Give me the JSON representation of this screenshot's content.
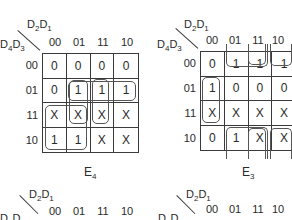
{
  "maps": [
    {
      "title": "E",
      "title_sub": "4",
      "col_var": {
        "a": "D",
        "a_sub": "2",
        "b": "D",
        "b_sub": "1"
      },
      "row_var": {
        "a": "D",
        "a_sub": "4",
        "b": "D",
        "b_sub": "3"
      },
      "col_labels": [
        "00",
        "01",
        "11",
        "10"
      ],
      "row_labels": [
        "00",
        "01",
        "11",
        "10"
      ],
      "cells": [
        [
          "0",
          "0",
          "0",
          "0"
        ],
        [
          "0",
          "1",
          "1",
          "1"
        ],
        [
          "X",
          "X",
          "X",
          "X"
        ],
        [
          "1",
          "1",
          "X",
          "X"
        ]
      ]
    },
    {
      "title": "E",
      "title_sub": "3",
      "col_var": {
        "a": "D",
        "a_sub": "2",
        "b": "D",
        "b_sub": "1"
      },
      "row_var": {
        "a": "D",
        "a_sub": "4",
        "b": "D",
        "b_sub": "3"
      },
      "col_labels": [
        "00",
        "01",
        "11",
        "10"
      ],
      "row_labels": [
        "00",
        "01",
        "11",
        "10"
      ],
      "cells": [
        [
          "0",
          "1",
          "1",
          "1"
        ],
        [
          "1",
          "0",
          "0",
          "0"
        ],
        [
          "X",
          "X",
          "X",
          "X"
        ],
        [
          "0",
          "1",
          "X",
          "X"
        ]
      ]
    },
    {
      "col_var": {
        "a": "D",
        "a_sub": "2",
        "b": "D",
        "b_sub": "1"
      },
      "row_var": {
        "a": "D",
        "a_sub": "4",
        "b": "D",
        "b_sub": "3"
      },
      "col_labels": [
        "00",
        "01",
        "11",
        "10"
      ]
    },
    {
      "col_var": {
        "a": "D",
        "a_sub": "2",
        "b": "D",
        "b_sub": "1"
      },
      "row_var": {
        "a": "D",
        "a_sub": "4",
        "b": "D",
        "b_sub": "3"
      },
      "col_labels": [
        "00",
        "01",
        "11",
        "10"
      ]
    }
  ]
}
